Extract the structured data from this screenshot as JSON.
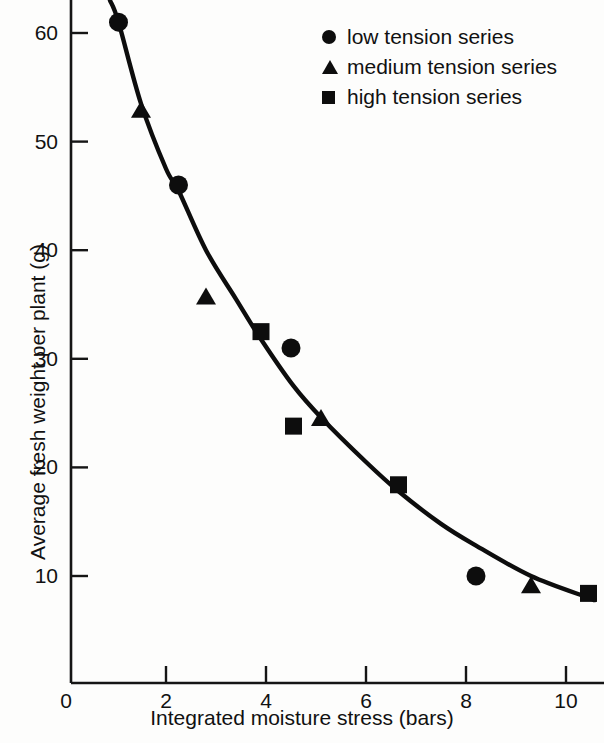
{
  "chart_data": {
    "type": "scatter",
    "title": "",
    "xlabel": "Integrated moisture stress (bars)",
    "ylabel": "Average fresh weight per plant (g)",
    "xlim": [
      0,
      11.2
    ],
    "ylim": [
      0,
      63
    ],
    "xticks": [
      0,
      2,
      4,
      6,
      8,
      10
    ],
    "xtick_labels": [
      "0",
      "2",
      "4",
      "6",
      "8",
      "10"
    ],
    "yticks": [
      10,
      20,
      30,
      40,
      50,
      60
    ],
    "ytick_labels": [
      "10",
      "20",
      "30",
      "40",
      "50",
      "60"
    ],
    "grid": false,
    "legend_position": "top-right",
    "series": [
      {
        "name": "low tension series",
        "marker": "circle",
        "color": "#0d0d0d",
        "points": [
          {
            "x": 1.05,
            "y": 61.0
          },
          {
            "x": 2.25,
            "y": 46.0
          },
          {
            "x": 4.5,
            "y": 31.0
          },
          {
            "x": 8.2,
            "y": 10.0
          }
        ]
      },
      {
        "name": "medium tension series",
        "marker": "triangle",
        "color": "#0d0d0d",
        "points": [
          {
            "x": 1.5,
            "y": 52.8
          },
          {
            "x": 2.8,
            "y": 35.6
          },
          {
            "x": 5.1,
            "y": 24.4
          },
          {
            "x": 9.3,
            "y": 9.0
          }
        ]
      },
      {
        "name": "high tension series",
        "marker": "square",
        "color": "#0d0d0d",
        "points": [
          {
            "x": 3.9,
            "y": 32.5
          },
          {
            "x": 4.55,
            "y": 23.8
          },
          {
            "x": 6.65,
            "y": 18.4
          },
          {
            "x": 10.45,
            "y": 8.4
          }
        ]
      }
    ],
    "fit_curve": {
      "name": "fitted exponential decay trend",
      "color": "#0d0d0d",
      "points": [
        {
          "x": 0.88,
          "y": 63.0
        },
        {
          "x": 1.05,
          "y": 61.0
        },
        {
          "x": 1.5,
          "y": 53.5
        },
        {
          "x": 2.0,
          "y": 47.5
        },
        {
          "x": 2.25,
          "y": 45.5
        },
        {
          "x": 2.8,
          "y": 40.0
        },
        {
          "x": 3.4,
          "y": 35.5
        },
        {
          "x": 3.9,
          "y": 31.8
        },
        {
          "x": 4.55,
          "y": 27.5
        },
        {
          "x": 5.1,
          "y": 24.6
        },
        {
          "x": 6.0,
          "y": 20.5
        },
        {
          "x": 6.65,
          "y": 17.8
        },
        {
          "x": 7.5,
          "y": 14.8
        },
        {
          "x": 8.2,
          "y": 12.8
        },
        {
          "x": 9.3,
          "y": 10.0
        },
        {
          "x": 10.45,
          "y": 8.0
        },
        {
          "x": 10.55,
          "y": 7.8
        }
      ]
    }
  },
  "legend": {
    "items": [
      {
        "label": "low tension series",
        "marker": "circle"
      },
      {
        "label": "medium tension series",
        "marker": "triangle"
      },
      {
        "label": "high tension series",
        "marker": "square"
      }
    ]
  },
  "axes": {
    "x_title": "Integrated moisture stress (bars)",
    "y_title": "Average fresh weight per plant (g)",
    "x_tick_labels": [
      "0",
      "2",
      "4",
      "6",
      "8",
      "10"
    ],
    "y_tick_labels": [
      "60",
      "50",
      "40",
      "30",
      "20",
      "10"
    ]
  }
}
